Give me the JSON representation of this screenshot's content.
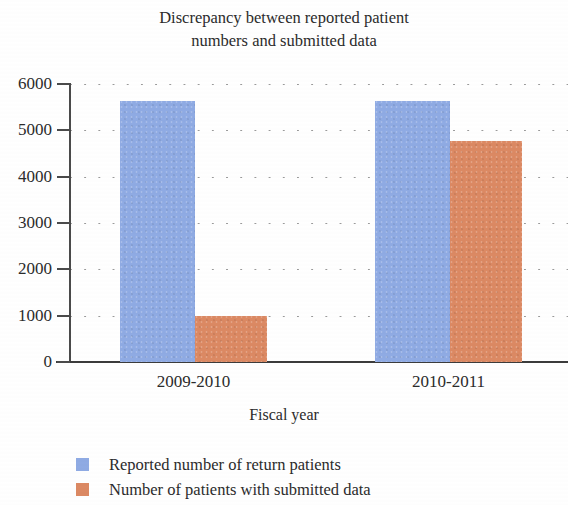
{
  "chart_data": {
    "type": "bar",
    "title": "Discrepancy between reported patient numbers and submitted data",
    "title_lines": [
      "Discrepancy between reported patient",
      "numbers and submitted data"
    ],
    "xlabel": "Fiscal year",
    "ylabel": "",
    "categories": [
      "2009-2010",
      "2010-2011"
    ],
    "series": [
      {
        "name": "Reported number of return patients",
        "color": "#8fabe4",
        "values": [
          5640,
          5630
        ]
      },
      {
        "name": "Number of patients with submitted data",
        "color": "#dc8963",
        "values": [
          1000,
          4760
        ]
      }
    ],
    "ylim": [
      0,
      6000
    ],
    "ytick_labels": [
      "6000",
      "5000",
      "4000",
      "3000",
      "2000",
      "1000",
      "0"
    ],
    "ytick_values": [
      6000,
      5000,
      4000,
      3000,
      2000,
      1000,
      0
    ],
    "grid": "horizontal-dotted",
    "legend_position": "bottom-left"
  },
  "legend": {
    "items": [
      {
        "label": "Reported number of return patients",
        "color": "#8fabe4"
      },
      {
        "label": "Number of patients with submitted data",
        "color": "#dc8963"
      }
    ]
  }
}
